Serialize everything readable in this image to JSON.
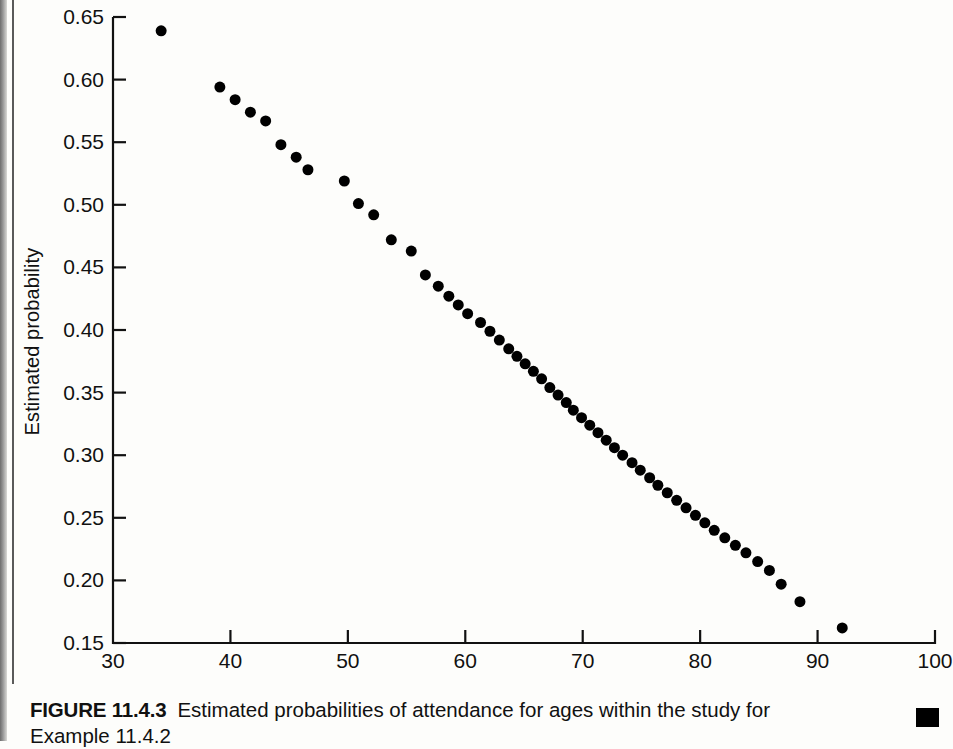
{
  "figure": {
    "number_label": "FIGURE 11.4.3",
    "caption_line1": "Estimated probabilities of attendance for ages within the study for",
    "caption_line2": "Example 11.4.2",
    "end_marker": "black-square"
  },
  "chart_data": {
    "type": "scatter",
    "title": "",
    "subtitle": "",
    "xlabel": "",
    "ylabel": "Estimated probability",
    "xlim": [
      30,
      100
    ],
    "ylim": [
      0.15,
      0.65
    ],
    "grid": false,
    "legend": null,
    "legend_position": "none",
    "marker": {
      "shape": "circle",
      "color": "#000000",
      "size_px": 11
    },
    "axis_color": "#111111",
    "background_color": "#fdfdfb",
    "xticks": [
      30,
      40,
      50,
      60,
      70,
      80,
      90,
      100
    ],
    "xtick_labels": [
      "30",
      "40",
      "50",
      "60",
      "70",
      "80",
      "90",
      "100"
    ],
    "yticks": [
      0.15,
      0.2,
      0.25,
      0.3,
      0.35,
      0.4,
      0.45,
      0.5,
      0.55,
      0.6,
      0.65
    ],
    "ytick_labels": [
      "0.15",
      "0.20",
      "0.25",
      "0.30",
      "0.35",
      "0.40",
      "0.45",
      "0.50",
      "0.55",
      "0.60",
      "0.65"
    ],
    "x": [
      34.1,
      39.1,
      40.4,
      41.7,
      43.0,
      44.3,
      45.6,
      46.6,
      49.7,
      50.9,
      52.2,
      53.7,
      55.4,
      56.6,
      57.7,
      58.6,
      59.4,
      60.2,
      61.3,
      62.1,
      62.9,
      63.7,
      64.4,
      65.1,
      65.8,
      66.5,
      67.2,
      67.9,
      68.6,
      69.2,
      69.9,
      70.6,
      71.3,
      72.0,
      72.7,
      73.4,
      74.2,
      74.9,
      75.7,
      76.4,
      77.2,
      78.0,
      78.8,
      79.6,
      80.4,
      81.2,
      82.1,
      83.0,
      83.9,
      84.9,
      85.9,
      86.9,
      88.5,
      92.1
    ],
    "y": [
      0.639,
      0.594,
      0.584,
      0.574,
      0.567,
      0.548,
      0.538,
      0.528,
      0.519,
      0.501,
      0.492,
      0.472,
      0.463,
      0.444,
      0.435,
      0.427,
      0.42,
      0.413,
      0.406,
      0.399,
      0.392,
      0.385,
      0.379,
      0.373,
      0.367,
      0.361,
      0.354,
      0.348,
      0.342,
      0.336,
      0.33,
      0.324,
      0.318,
      0.312,
      0.306,
      0.3,
      0.294,
      0.288,
      0.282,
      0.276,
      0.27,
      0.264,
      0.258,
      0.252,
      0.246,
      0.24,
      0.234,
      0.228,
      0.222,
      0.215,
      0.208,
      0.197,
      0.183,
      0.162
    ],
    "n_points": 54
  }
}
